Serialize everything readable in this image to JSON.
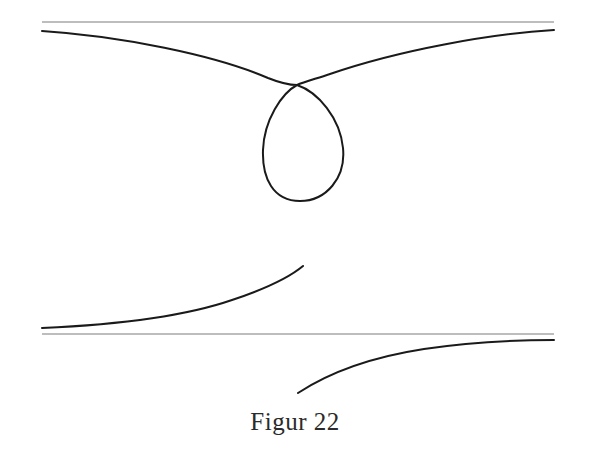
{
  "figure": {
    "caption": "Figur 22",
    "background_color": "#ffffff",
    "curve_color": "#1a1a1a",
    "asymptote_color": "#7d7d7d",
    "curve_stroke_width": 2.0,
    "asymptote_stroke_width": 1.1,
    "width": 590,
    "height": 456
  },
  "chart_data": {
    "type": "line",
    "title": "Figur 22",
    "xlabel": "",
    "ylabel": "",
    "grid": false,
    "legend": false,
    "xlim": [
      0,
      590
    ],
    "ylim": [
      456,
      0
    ],
    "series": [
      {
        "name": "upper-asymptote",
        "kind": "asymptote",
        "orientation": "horizontal",
        "y": 22,
        "x_start": 42,
        "x_end": 554
      },
      {
        "name": "lower-asymptote",
        "kind": "asymptote",
        "orientation": "horizontal",
        "y": 334,
        "x_start": 42,
        "x_end": 554
      },
      {
        "name": "looped-branch-with-node",
        "kind": "curve",
        "closed_loop": true,
        "node_point": [
          297,
          85
        ],
        "loop_extent": {
          "left": 262,
          "right": 343,
          "bottom": 201,
          "top": 85
        },
        "path": "M 42 31 C 120 36, 215 55, 268 78 C 283 84, 291 85, 297 85 C 318 92, 340 118, 343 148 C 346 178, 326 201, 300 201 C 273 201, 262 178, 263 150 C 264 120, 282 93, 297 85 C 304 82, 315 79, 330 74 C 400 50, 490 34, 554 30"
      },
      {
        "name": "lower-left-branch",
        "kind": "curve",
        "asymptotic_to": "lower-asymptote",
        "free_endpoint": [
          303,
          266
        ],
        "path": "M 42 328 C 110 325, 180 318, 232 300 C 268 288, 291 276, 303 266"
      },
      {
        "name": "lower-right-branch",
        "kind": "curve",
        "asymptotic_to": "lower-asymptote",
        "free_endpoint": [
          298,
          393
        ],
        "path": "M 298 393 C 330 372, 372 357, 424 349 C 470 342, 520 340, 554 340"
      }
    ]
  }
}
